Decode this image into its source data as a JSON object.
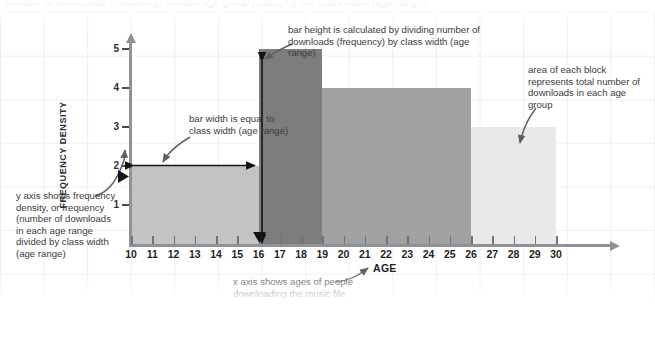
{
  "caption": {
    "top_cutoff_line": "number of downloads (frequency) in each age group (class) by the class width (age range)."
  },
  "axes": {
    "y_title": "FREQUENCY DENSITY",
    "x_title": "AGE",
    "y_ticks": [
      "1",
      "2",
      "3",
      "4",
      "5"
    ],
    "x_ticks": [
      "10",
      "11",
      "12",
      "13",
      "14",
      "15",
      "16",
      "17",
      "18",
      "19",
      "20",
      "21",
      "22",
      "23",
      "24",
      "25",
      "26",
      "27",
      "28",
      "29",
      "30"
    ]
  },
  "annotations": {
    "y_axis_note": "y axis shows frequency density, or frequency (number of downloads in each age range divided by class width (age range)",
    "bar_width_note": "bar width is equal to class width (age range)",
    "bar_height_note": "bar height is calculated by dividing number of downloads (frequency) by class width (age range)",
    "area_note": "area of each block represents total number of downloads in each age group",
    "x_axis_note": "x axis shows ages of people downloading the music file"
  },
  "colors": {
    "bar_1": "#c3c3c3",
    "bar_2": "#7d7d7d",
    "bar_3": "#a1a1a1",
    "bar_4": "#e9e9e9",
    "axis": "#8e9296",
    "arrow": "#1a1a1a",
    "callout_arrow": "#5d6166",
    "text": "#3c3c3c"
  },
  "chart_data": {
    "type": "bar",
    "title": "",
    "xlabel": "AGE",
    "ylabel": "FREQUENCY DENSITY",
    "xlim": [
      10,
      30
    ],
    "ylim": [
      0,
      5.6
    ],
    "grid": false,
    "legend": "none",
    "note": "Histogram with unequal class widths; bar height = frequency density = frequency / class width; bar area = frequency.",
    "bins": [
      {
        "label": "10-16",
        "x_start": 10,
        "x_end": 16,
        "class_width": 6,
        "frequency_density": 2,
        "frequency": 12,
        "color": "#c3c3c3"
      },
      {
        "label": "16-19",
        "x_start": 16,
        "x_end": 19,
        "class_width": 3,
        "frequency_density": 5,
        "frequency": 15,
        "color": "#7d7d7d"
      },
      {
        "label": "19-26",
        "x_start": 19,
        "x_end": 26,
        "class_width": 7,
        "frequency_density": 4,
        "frequency": 28,
        "color": "#a1a1a1"
      },
      {
        "label": "26-30",
        "x_start": 26,
        "x_end": 30,
        "class_width": 4,
        "frequency_density": 3,
        "frequency": 12,
        "color": "#e9e9e9"
      }
    ]
  }
}
